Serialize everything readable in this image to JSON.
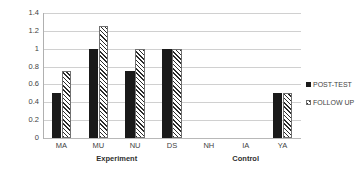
{
  "chart_data": {
    "type": "bar",
    "title": "",
    "subtitle": "",
    "xlabel": "",
    "ylabel": "",
    "categories": [
      "MA",
      "MU",
      "NU",
      "DS",
      "NH",
      "IA",
      "YA"
    ],
    "series": [
      {
        "name": "POST-TEST",
        "values": [
          0.5,
          1,
          0.75,
          1,
          0,
          0,
          0.5
        ]
      },
      {
        "name": "FOLLOW UP",
        "values": [
          0.75,
          1.25,
          1,
          1,
          0,
          0,
          0.5
        ]
      }
    ],
    "ylim": [
      0,
      1.4
    ],
    "ytick_labels": [
      "1.4",
      "1.2",
      "1",
      "0.8",
      "0.6",
      "0.4",
      "0.2",
      "0"
    ],
    "ytick_values": [
      1.4,
      1.2,
      1,
      0.8,
      0.6,
      0.4,
      0.2,
      0
    ],
    "grid": true,
    "grid_axis": "y",
    "legend_position": "right",
    "groups": [
      {
        "label": "Experiment",
        "categories": [
          "MA",
          "MU",
          "NU",
          "DS"
        ]
      },
      {
        "label": "Control",
        "categories": [
          "NH",
          "IA",
          "YA"
        ]
      }
    ],
    "colors": {
      "post_test": "#1a1a1a",
      "follow_up_hatch": "#2b2b2b",
      "gridline": "#d0d0d0",
      "axis": "#b0b0b0",
      "text": "#3f3f3f",
      "background": "#ffffff"
    }
  },
  "legend": {
    "items": [
      {
        "label": "POST-TEST",
        "marker": "solid-square-icon"
      },
      {
        "label": "FOLLOW UP",
        "marker": "hatched-square-icon"
      }
    ]
  }
}
